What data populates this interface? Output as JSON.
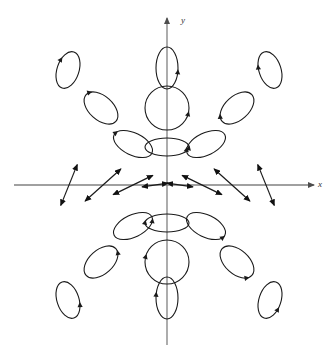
{
  "figure": {
    "kind": "phase-portrait",
    "title": "",
    "background_color": "#ffffff",
    "axis_color": "#808080",
    "curve_color": "#1a1a1a",
    "label_color": "#333333"
  },
  "axes": {
    "origin": {
      "x": 167,
      "y": 185
    },
    "x_axis": {
      "label": "x",
      "label_position": {
        "x": 318,
        "y": 180
      },
      "start": {
        "x": 14,
        "y": 185
      },
      "end": {
        "x": 314,
        "y": 185
      },
      "arrow_end": "right"
    },
    "y_axis": {
      "label": "y",
      "label_position": {
        "x": 181,
        "y": 16
      },
      "start": {
        "x": 167,
        "y": 345
      },
      "end": {
        "x": 167,
        "y": 18
      },
      "arrow_end": "top"
    }
  },
  "chart_data": {
    "type": "scatter",
    "title": "",
    "xlabel": "x",
    "ylabel": "y",
    "grid": false,
    "legend": null,
    "ellipses": [
      {
        "cx": 68,
        "cy": 70,
        "rx": 11,
        "ry": 19,
        "rot": 18,
        "arrow_t": 205,
        "dir": "ccw"
      },
      {
        "cx": 167,
        "cy": 68,
        "rx": 11,
        "ry": 21,
        "rot": 0,
        "arrow_t": 10,
        "dir": "cw"
      },
      {
        "cx": 270,
        "cy": 70,
        "rx": 11,
        "ry": 19,
        "rot": -18,
        "arrow_t": 200,
        "dir": "ccw"
      },
      {
        "cx": 101,
        "cy": 108,
        "rx": 20,
        "ry": 12,
        "rot": 42,
        "arrow_t": 200,
        "dir": "ccw"
      },
      {
        "cx": 167,
        "cy": 108,
        "rx": 22,
        "ry": 22,
        "rot": 0,
        "arrow_t": 15,
        "dir": "cw"
      },
      {
        "cx": 237,
        "cy": 108,
        "rx": 20,
        "ry": 12,
        "rot": -42,
        "arrow_t": 205,
        "dir": "ccw"
      },
      {
        "cx": 133,
        "cy": 144,
        "rx": 21,
        "ry": 11,
        "rot": 26,
        "arrow_t": 195,
        "dir": "ccw"
      },
      {
        "cx": 167,
        "cy": 147,
        "rx": 22,
        "ry": 9,
        "rot": 0,
        "arrow_t": 5,
        "dir": "cw"
      },
      {
        "cx": 206,
        "cy": 144,
        "rx": 21,
        "ry": 11,
        "rot": -26,
        "arrow_t": 200,
        "dir": "ccw"
      },
      {
        "cx": 133,
        "cy": 226,
        "rx": 21,
        "ry": 11,
        "rot": -26,
        "arrow_t": 20,
        "dir": "cw"
      },
      {
        "cx": 167,
        "cy": 223,
        "rx": 22,
        "ry": 9,
        "rot": 0,
        "arrow_t": 185,
        "dir": "ccw"
      },
      {
        "cx": 206,
        "cy": 226,
        "rx": 21,
        "ry": 11,
        "rot": 26,
        "arrow_t": 15,
        "dir": "cw"
      },
      {
        "cx": 101,
        "cy": 262,
        "rx": 20,
        "ry": 12,
        "rot": -42,
        "arrow_t": 20,
        "dir": "cw"
      },
      {
        "cx": 167,
        "cy": 262,
        "rx": 22,
        "ry": 22,
        "rot": 0,
        "arrow_t": 195,
        "dir": "ccw"
      },
      {
        "cx": 237,
        "cy": 262,
        "rx": 20,
        "ry": 12,
        "rot": 42,
        "arrow_t": 25,
        "dir": "cw"
      },
      {
        "cx": 68,
        "cy": 300,
        "rx": 11,
        "ry": 19,
        "rot": -18,
        "arrow_t": 25,
        "dir": "cw"
      },
      {
        "cx": 167,
        "cy": 298,
        "rx": 11,
        "ry": 21,
        "rot": 0,
        "arrow_t": 190,
        "dir": "ccw"
      },
      {
        "cx": 270,
        "cy": 300,
        "rx": 11,
        "ry": 19,
        "rot": 18,
        "arrow_t": 20,
        "dir": "cw"
      }
    ],
    "axis_segments": [
      {
        "cx": 69,
        "cy": 185,
        "len": 44,
        "angle": -68,
        "heads": "both"
      },
      {
        "cx": 103,
        "cy": 185,
        "len": 48,
        "angle": -42,
        "heads": "both"
      },
      {
        "cx": 133,
        "cy": 185,
        "len": 44,
        "angle": -26,
        "heads": "both"
      },
      {
        "cx": 155,
        "cy": 185,
        "len": 26,
        "angle": -8,
        "heads": "both"
      },
      {
        "cx": 180,
        "cy": 185,
        "len": 26,
        "angle": 8,
        "heads": "both"
      },
      {
        "cx": 202,
        "cy": 185,
        "len": 44,
        "angle": 26,
        "heads": "both"
      },
      {
        "cx": 232,
        "cy": 185,
        "len": 48,
        "angle": 42,
        "heads": "both"
      },
      {
        "cx": 266,
        "cy": 185,
        "len": 44,
        "angle": 68,
        "heads": "both"
      }
    ]
  }
}
